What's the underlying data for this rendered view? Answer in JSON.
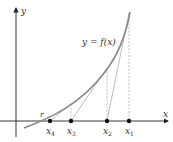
{
  "diagram": {
    "axes": {
      "x_label": "x",
      "y_label": "y"
    },
    "curve_label": "y = f(x)",
    "root_label": "r",
    "points": [
      {
        "name": "x",
        "sub": "4",
        "x": 50
      },
      {
        "name": "x",
        "sub": "3",
        "x": 71
      },
      {
        "name": "x",
        "sub": "2",
        "x": 107
      },
      {
        "name": "x",
        "sub": "1",
        "x": 129
      }
    ],
    "colors": {
      "curve": "#8a8a8a",
      "axis": "#222222",
      "tangent": "#a0a0a0",
      "dashed": "#a0a0a0"
    }
  }
}
